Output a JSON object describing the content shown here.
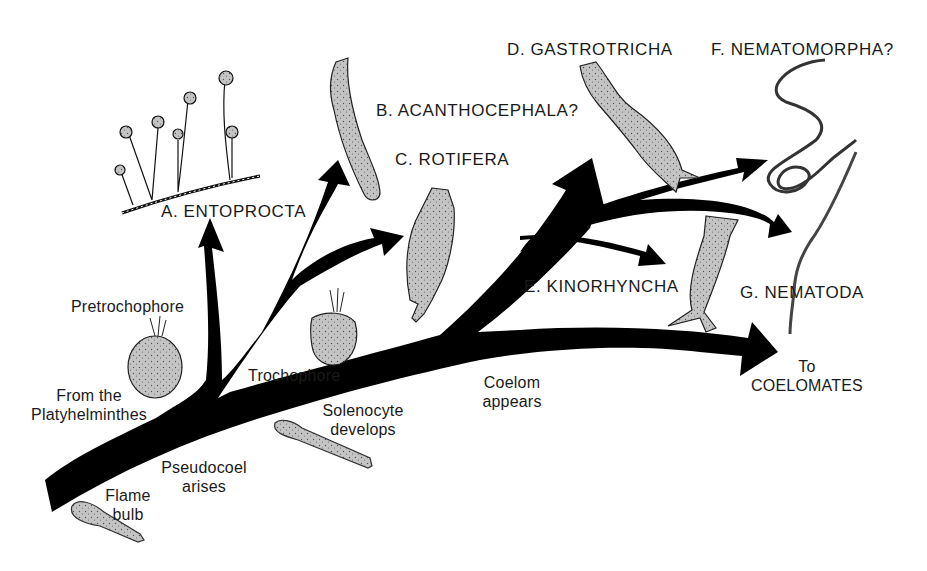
{
  "figure": {
    "type": "phylogenetic-tree",
    "colors": {
      "branch": "#000000",
      "organism_fill": "#c8c8c8",
      "background": "#ffffff",
      "text": "#1a1a1a"
    }
  },
  "clades": [
    {
      "id": "A",
      "label": "A. ENTOPROCTA"
    },
    {
      "id": "B",
      "label": "B. ACANTHOCEPHALA?"
    },
    {
      "id": "C",
      "label": "C. ROTIFERA"
    },
    {
      "id": "D",
      "label": "D. GASTROTRICHA"
    },
    {
      "id": "E",
      "label": "E. KINORHYNCHA"
    },
    {
      "id": "F",
      "label": "F. NEMATOMORPHA?"
    },
    {
      "id": "G",
      "label": "G. NEMATODA"
    }
  ],
  "annotations": {
    "origin_line1": "From the",
    "origin_line2": "Platyhelminthes",
    "pretrochophore": "Pretrochophore",
    "trochophore": "Trochophore",
    "flame_line1": "Flame",
    "flame_line2": "bulb",
    "pseudocoel_line1": "Pseudocoel",
    "pseudocoel_line2": "arises",
    "solenocyte_line1": "Solenocyte",
    "solenocyte_line2": "develops",
    "coelom_line1": "Coelom",
    "coelom_line2": "appears",
    "coelomates_line1": "To",
    "coelomates_line2": "COELOMATES"
  },
  "illustrations": [
    "entoproct-colony",
    "acanthocephalan-worm",
    "rotifer",
    "gastrotrich",
    "nematomorph-worm",
    "kinorhynch",
    "nematode-worm",
    "pretrochophore-larva",
    "trochophore-larva",
    "flame-bulb-cell",
    "solenocyte-cell"
  ]
}
